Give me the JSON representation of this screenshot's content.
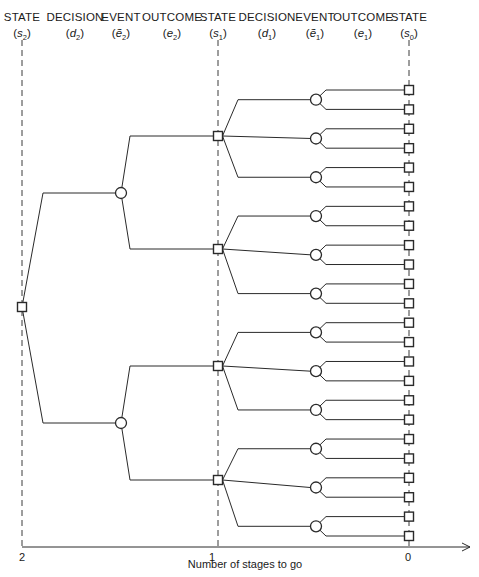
{
  "header": {
    "columns": [
      {
        "label": "STATE",
        "symbol": "s",
        "accent": false,
        "sub": "2",
        "x": 22
      },
      {
        "label": "DECISION",
        "symbol": "d",
        "accent": false,
        "sub": "2",
        "x": 75
      },
      {
        "label": "EVENT",
        "symbol": "e",
        "accent": true,
        "sub": "2",
        "x": 121
      },
      {
        "label": "OUTCOME",
        "symbol": "e",
        "accent": false,
        "sub": "2",
        "x": 172
      },
      {
        "label": "STATE",
        "symbol": "s",
        "accent": false,
        "sub": "1",
        "x": 218
      },
      {
        "label": "DECISION",
        "symbol": "d",
        "accent": false,
        "sub": "1",
        "x": 267
      },
      {
        "label": "EVENT",
        "symbol": "e",
        "accent": true,
        "sub": "1",
        "x": 315
      },
      {
        "label": "OUTCOME",
        "symbol": "e",
        "accent": false,
        "sub": "1",
        "x": 363
      },
      {
        "label": "STATE",
        "symbol": "s",
        "accent": false,
        "sub": "0",
        "x": 409
      }
    ]
  },
  "axis": {
    "ticks": [
      {
        "label": "2",
        "x": 22
      },
      {
        "label": "1",
        "x": 212
      },
      {
        "label": "0",
        "x": 408
      }
    ],
    "title": "Number of stages to go",
    "y": 547
  },
  "tree": {
    "root": {
      "x": 22,
      "y": 307
    },
    "stage2_events": [
      {
        "x": 121,
        "y": 193,
        "decisions": [
          {
            "x": 218,
            "y": 136
          },
          {
            "x": 218,
            "y": 249
          }
        ]
      },
      {
        "x": 121,
        "y": 423,
        "decisions": [
          {
            "x": 218,
            "y": 366
          },
          {
            "x": 218,
            "y": 480
          }
        ]
      }
    ],
    "stage1_event_x": 316,
    "terminal_x": 409,
    "terminal_y_start": 90,
    "terminal_y_end": 536,
    "terminal_count": 24
  },
  "style": {
    "line_color": "#2a2a2a",
    "dash_color": "#3a3a3a",
    "background": "#ffffff"
  }
}
